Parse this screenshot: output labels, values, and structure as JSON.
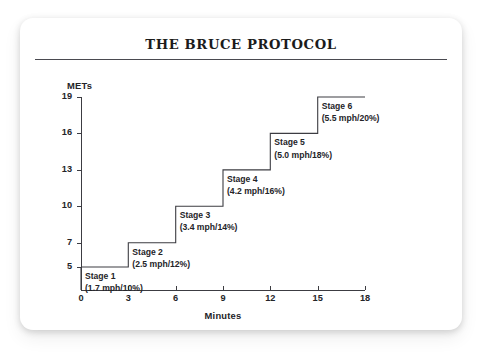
{
  "card": {
    "title": "THE BRUCE PROTOCOL"
  },
  "chart_data": {
    "type": "line",
    "subtype": "step",
    "title": "THE BRUCE PROTOCOL",
    "xlabel": "Minutes",
    "ylabel": "METs",
    "xlim": [
      0,
      18
    ],
    "ylim": [
      3.1,
      19
    ],
    "grid": false,
    "legend": "none",
    "x_ticks": [
      "0",
      "3",
      "6",
      "9",
      "12",
      "15",
      "18"
    ],
    "x_tick_values": [
      0,
      3,
      6,
      9,
      12,
      15,
      18
    ],
    "y_ticks": [
      "5",
      "7",
      "10",
      "13",
      "16",
      "19"
    ],
    "y_tick_values": [
      5,
      7,
      10,
      13,
      16,
      19
    ],
    "line_color": "#3c3c42",
    "x": [
      0,
      3,
      3,
      6,
      6,
      9,
      9,
      12,
      12,
      15,
      15,
      18
    ],
    "y": [
      5,
      5,
      7,
      7,
      10,
      10,
      13,
      13,
      16,
      16,
      19,
      19
    ],
    "steps": [
      {
        "start_min": 0,
        "end_min": 3,
        "mets": 5
      },
      {
        "start_min": 3,
        "end_min": 6,
        "mets": 7
      },
      {
        "start_min": 6,
        "end_min": 9,
        "mets": 10
      },
      {
        "start_min": 9,
        "end_min": 12,
        "mets": 13
      },
      {
        "start_min": 12,
        "end_min": 15,
        "mets": 16
      },
      {
        "start_min": 15,
        "end_min": 18,
        "mets": 19
      }
    ],
    "annotations": [
      {
        "name": "Stage 1",
        "detail": "(1.7 mph/10%)",
        "speed_mph": 1.7,
        "grade_pct": 10,
        "mets": 5
      },
      {
        "name": "Stage 2",
        "detail": "(2.5 mph/12%)",
        "speed_mph": 2.5,
        "grade_pct": 12,
        "mets": 7
      },
      {
        "name": "Stage 3",
        "detail": "(3.4 mph/14%)",
        "speed_mph": 3.4,
        "grade_pct": 14,
        "mets": 10
      },
      {
        "name": "Stage 4",
        "detail": "(4.2 mph/16%)",
        "speed_mph": 4.2,
        "grade_pct": 16,
        "mets": 13
      },
      {
        "name": "Stage 5",
        "detail": "(5.0 mph/18%)",
        "speed_mph": 5.0,
        "grade_pct": 18,
        "mets": 16
      },
      {
        "name": "Stage 6",
        "detail": "(5.5 mph/20%)",
        "speed_mph": 5.5,
        "grade_pct": 20,
        "mets": 19
      }
    ]
  },
  "colors": {
    "ink": "#242428",
    "axis": "#3c3c42",
    "rule": "#4a4a50",
    "card_bg": "#ffffff",
    "page_bg": "#ffffff"
  }
}
